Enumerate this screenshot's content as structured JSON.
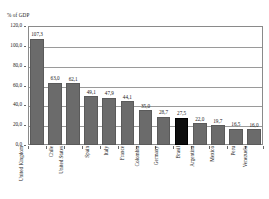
{
  "axis_caption": "% of GDP",
  "colors": {
    "bar": "#6b6b6b",
    "bar_highlight": "#0d0d0d",
    "grid": "#9a9a9a",
    "frame": "#8a8a8a",
    "text": "#1a1a1a"
  },
  "chart_data": {
    "type": "bar",
    "title": "",
    "subtitle": "",
    "xlabel": "",
    "ylabel": "% of GDP",
    "ylim": [
      0,
      120
    ],
    "ytick_labels": [
      "0,0",
      "20,0",
      "40,0",
      "60,0",
      "80,0",
      "100,0",
      "120,0"
    ],
    "ytick_values": [
      0,
      20,
      40,
      60,
      80,
      100,
      120
    ],
    "grid": true,
    "legend": "none",
    "decimal_separator": ",",
    "highlight_category": "Brasil",
    "categories": [
      "United Kingdom",
      "Chile",
      "United States",
      "Spain",
      "Italy",
      "France",
      "Colombia",
      "Germany",
      "Brasil",
      "Argentina",
      "Mexico",
      "Peru",
      "Venezuela"
    ],
    "values": [
      107.3,
      63.0,
      62.1,
      49.1,
      47.9,
      44.1,
      35.0,
      28.7,
      27.5,
      22.0,
      19.7,
      16.5,
      16.0
    ],
    "value_labels": [
      "107,3",
      "63,0",
      "62,1",
      "49,1",
      "47,9",
      "44,1",
      "35,0",
      "28,7",
      "27,5",
      "22,0",
      "19,7",
      "16,5",
      "16,0"
    ]
  }
}
